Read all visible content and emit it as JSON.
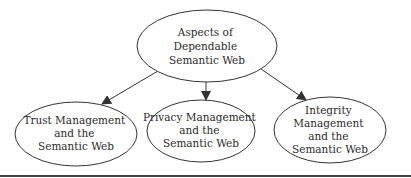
{
  "diagram": {
    "root": {
      "id": "aspects",
      "lines": [
        "Aspects of",
        "Dependable",
        "Semantic Web"
      ],
      "cx": 207,
      "cy": 46,
      "rx": 70,
      "ry": 36
    },
    "children": [
      {
        "id": "trust",
        "lines": [
          "Trust Management",
          "and the",
          "Semantic Web"
        ],
        "cx": 76,
        "cy": 134,
        "rx": 61,
        "ry": 32
      },
      {
        "id": "privacy",
        "lines": [
          "Privacy Management",
          "and the",
          "Semantic Web"
        ],
        "cx": 201,
        "cy": 131,
        "rx": 54,
        "ry": 31
      },
      {
        "id": "integrity",
        "lines": [
          "Integrity",
          "Management",
          "and the",
          "Semantic Web"
        ],
        "cx": 330,
        "cy": 130,
        "rx": 56,
        "ry": 33
      }
    ],
    "edges": [
      {
        "from": "aspects",
        "to": "trust"
      },
      {
        "from": "aspects",
        "to": "privacy"
      },
      {
        "from": "aspects",
        "to": "integrity"
      }
    ],
    "colors": {
      "stroke": "#333333",
      "text": "#2a2a2a",
      "rule": "#444444"
    }
  }
}
